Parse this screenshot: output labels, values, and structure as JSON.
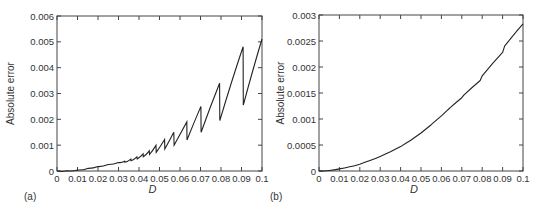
{
  "chart_data": [
    {
      "type": "line",
      "panel": "(a)",
      "title": "",
      "xlabel": "D",
      "ylabel": "Absolute error",
      "xlim": [
        0,
        0.1
      ],
      "ylim": [
        0,
        0.006
      ],
      "xticks": [
        "0",
        "0.01",
        "0.02",
        "0.03",
        "0.04",
        "0.05",
        "0.06",
        "0.07",
        "0.08",
        "0.09",
        "0.1"
      ],
      "yticks": [
        "0",
        "0.001",
        "0.002",
        "0.003",
        "0.004",
        "0.005",
        "0.006"
      ],
      "grid": false,
      "legend": null,
      "frame_px": {
        "left": 57,
        "right": 262,
        "top": 16,
        "bottom": 171
      },
      "series": [
        {
          "name": "absolute error (sawtooth)",
          "x": [
            0,
            0.005,
            0.01,
            0.015,
            0.02,
            0.025,
            0.03,
            0.033,
            0.0331,
            0.036,
            0.0361,
            0.039,
            0.0391,
            0.042,
            0.0421,
            0.045,
            0.0451,
            0.0483,
            0.0484,
            0.0525,
            0.0526,
            0.057,
            0.0571,
            0.0633,
            0.0634,
            0.0702,
            0.0703,
            0.0793,
            0.0794,
            0.0908,
            0.0909,
            0.1
          ],
          "y": [
            0,
            1e-05,
            4e-05,
            0.0001,
            0.00017,
            0.00025,
            0.00033,
            0.00038,
            0.00034,
            0.00046,
            0.0004,
            0.00055,
            0.00047,
            0.00066,
            0.00055,
            0.00078,
            0.00064,
            0.00099,
            0.00072,
            0.00122,
            0.00085,
            0.0015,
            0.001,
            0.0019,
            0.0012,
            0.0025,
            0.0015,
            0.0034,
            0.00195,
            0.00481,
            0.00255,
            0.00511
          ]
        }
      ]
    },
    {
      "type": "line",
      "panel": "(b)",
      "title": "",
      "xlabel": "D",
      "ylabel": "Absolute error",
      "xlim": [
        0,
        0.1
      ],
      "ylim": [
        0,
        0.003
      ],
      "xticks": [
        "0",
        "0.01",
        "0.02",
        "0.03",
        "0.04",
        "0.05",
        "0.06",
        "0.07",
        "0.08",
        "0.09",
        "0.1"
      ],
      "yticks": [
        "0",
        "0.0005",
        "0.001",
        "0.0015",
        "0.002",
        "0.0025",
        "0.003"
      ],
      "grid": false,
      "legend": null,
      "frame_px": {
        "left": 319,
        "right": 523,
        "top": 15,
        "bottom": 171
      },
      "series": [
        {
          "name": "absolute error (smooth)",
          "x": [
            0,
            0.005,
            0.01,
            0.015,
            0.02,
            0.025,
            0.03,
            0.035,
            0.04,
            0.045,
            0.05,
            0.055,
            0.06,
            0.063,
            0.064,
            0.07,
            0.071,
            0.079,
            0.08,
            0.09,
            0.091,
            0.1
          ],
          "y": [
            0,
            1e-05,
            4e-05,
            8e-05,
            0.00013,
            0.0002,
            0.00028,
            0.00037,
            0.00047,
            0.00059,
            0.00073,
            0.00089,
            0.00106,
            0.00117,
            0.00121,
            0.00141,
            0.00146,
            0.00174,
            0.00183,
            0.00228,
            0.0024,
            0.00283
          ]
        }
      ]
    }
  ],
  "panels": {
    "a": {
      "label": "(a)",
      "xlabel": "D",
      "ylabel": "Absolute error"
    },
    "b": {
      "label": "(b)",
      "xlabel": "D",
      "ylabel": "Absolute error"
    }
  }
}
